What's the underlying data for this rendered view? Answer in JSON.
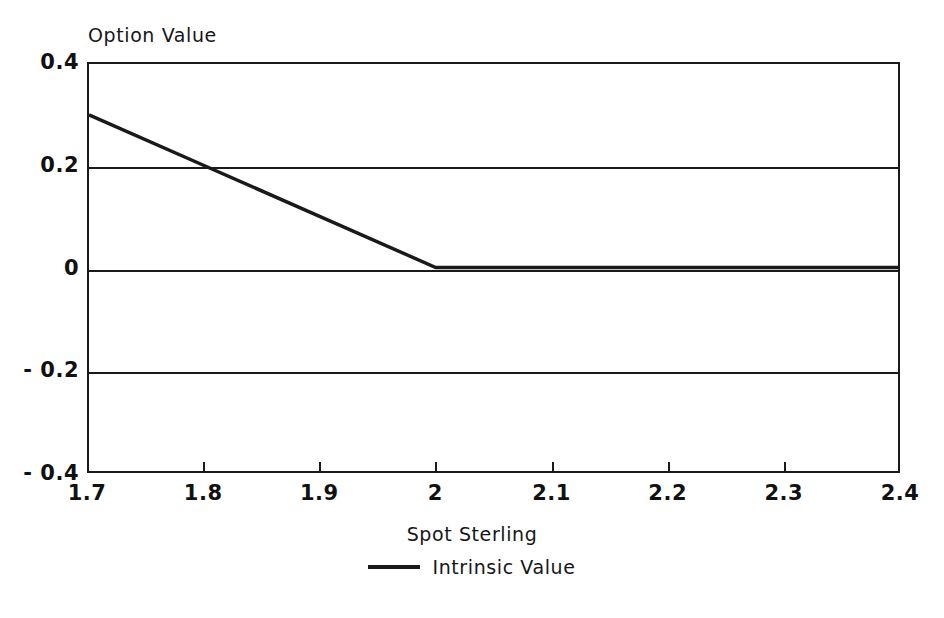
{
  "chart_data": {
    "type": "line",
    "title": "",
    "ylabel": "Option Value",
    "xlabel": "Spot Sterling",
    "xlim": [
      1.7,
      2.4
    ],
    "ylim": [
      -0.4,
      0.4
    ],
    "xticks": [
      "1.7",
      "1.8",
      "1.9",
      "2",
      "2.1",
      "2.2",
      "2.3",
      "2.4"
    ],
    "xtick_values": [
      1.7,
      1.8,
      1.9,
      2.0,
      2.1,
      2.2,
      2.3,
      2.4
    ],
    "yticks": [
      "0.4",
      "0.2",
      "0",
      "-0.2",
      "-0.4"
    ],
    "ytick_values": [
      0.4,
      0.2,
      0,
      -0.2,
      -0.4
    ],
    "grid": "horizontal",
    "legend_position": "bottom-center",
    "series": [
      {
        "name": "Intrinsic Value",
        "color": "#1a1a1a",
        "x": [
          1.7,
          1.8,
          1.9,
          2.0,
          2.1,
          2.2,
          2.3,
          2.4
        ],
        "values": [
          0.3,
          0.2,
          0.1,
          0.0,
          0.0,
          0.0,
          0.0,
          0.0
        ]
      }
    ]
  },
  "axes": {
    "y_title": "Option Value",
    "x_title": "Spot Sterling"
  },
  "legend": {
    "entries": [
      {
        "label": "Intrinsic Value"
      }
    ]
  },
  "colors": {
    "line": "#1a1a1a",
    "axis": "#1a1a1a",
    "text": "#111111",
    "background": "#ffffff"
  }
}
